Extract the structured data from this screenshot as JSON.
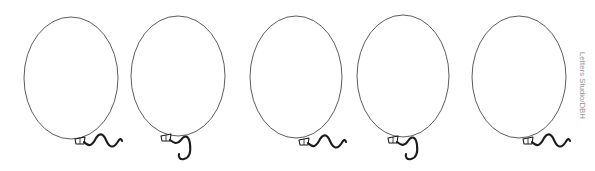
{
  "page": {
    "background_color": "#ffffff",
    "width": 595,
    "height": 171
  },
  "artwork": {
    "subject": "balloons",
    "count": 5,
    "style": "line-art outline",
    "outline_color": "#4a4a4a",
    "string_color": "#1a1a1a",
    "fill_color": "#ffffff"
  },
  "balloons": [
    {
      "name": "balloon-1",
      "cx": 71,
      "cy": 78,
      "rx": 47,
      "ry": 61,
      "knot_x": 79,
      "knot_y": 140,
      "string_length": "short",
      "string_path": "M 84 142 C 88 146 91 147 95 140 C 99 132 103 133 106 140 C 109 147 113 149 117 143 C 120 138 121 138 122 141"
    },
    {
      "name": "balloon-2",
      "cx": 178,
      "cy": 76,
      "rx": 47,
      "ry": 60,
      "knot_x": 165,
      "knot_y": 137,
      "string_length": "long",
      "string_path": "M 170 140 C 174 143 177 145 181 140 C 185 134 189 136 190 144 C 191 152 189 158 184 159 C 180 160 178 157 179 154"
    },
    {
      "name": "balloon-3",
      "cx": 296,
      "cy": 77,
      "rx": 46,
      "ry": 61,
      "knot_x": 303,
      "knot_y": 141,
      "string_length": "short",
      "string_path": "M 308 143 C 312 147 315 148 319 141 C 323 133 327 134 330 141 C 333 148 337 150 341 144 C 344 139 345 139 346 142"
    },
    {
      "name": "balloon-4",
      "cx": 403,
      "cy": 76,
      "rx": 46,
      "ry": 61,
      "knot_x": 392,
      "knot_y": 139,
      "string_length": "medium",
      "string_path": "M 397 142 C 401 145 404 147 408 141 C 412 135 416 137 417 145 C 418 153 416 158 411 159 C 407 160 405 157 406 154"
    },
    {
      "name": "balloon-5",
      "cx": 519,
      "cy": 77,
      "rx": 47,
      "ry": 61,
      "knot_x": 527,
      "knot_y": 140,
      "string_length": "short",
      "string_path": "M 532 142 C 536 146 539 147 543 140 C 547 132 551 133 554 140 C 557 147 561 149 565 143 C 568 138 569 138 570 141"
    }
  ],
  "watermark": {
    "text": "Letters Studio/DBH",
    "color": "#8d8d8d",
    "orientation": "vertical-right"
  }
}
